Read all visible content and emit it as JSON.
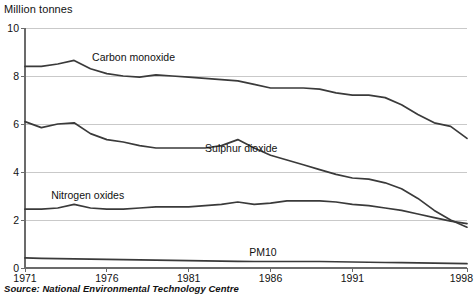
{
  "chart_data": {
    "type": "line",
    "title": "",
    "ylabel": "Million tonnes",
    "xlabel": "",
    "source": "Source: National Environmental Technology Centre",
    "ylim": [
      0,
      10
    ],
    "xlim": [
      1971,
      1998
    ],
    "grid": true,
    "legend_position": "inline-labels",
    "yticks": [
      0,
      2,
      4,
      6,
      8,
      10
    ],
    "ytick_labels": [
      "0",
      "2",
      "4",
      "6",
      "8",
      "10"
    ],
    "xticks": [
      1971,
      1976,
      1981,
      1986,
      1991,
      1998
    ],
    "xtick_labels": [
      "1971",
      "1976",
      "1981",
      "1986",
      "1991",
      "1998"
    ],
    "x": [
      1971,
      1972,
      1973,
      1974,
      1975,
      1976,
      1977,
      1978,
      1979,
      1980,
      1981,
      1982,
      1983,
      1984,
      1985,
      1986,
      1987,
      1988,
      1989,
      1990,
      1991,
      1992,
      1993,
      1994,
      1995,
      1996,
      1997,
      1998
    ],
    "series": [
      {
        "name": "Carbon monoxide",
        "label": "Carbon monoxide",
        "color": "#3a3a3a",
        "label_x": 1975.1,
        "label_y": 8.75,
        "values": [
          8.4,
          8.4,
          8.5,
          8.65,
          8.3,
          8.1,
          8.0,
          7.95,
          8.05,
          8.0,
          7.95,
          7.9,
          7.85,
          7.8,
          7.65,
          7.5,
          7.5,
          7.5,
          7.45,
          7.3,
          7.2,
          7.2,
          7.1,
          6.8,
          6.4,
          6.05,
          5.9,
          5.4
        ]
      },
      {
        "name": "Sulphur dioxide",
        "label": "Sulphur dioxide",
        "color": "#3a3a3a",
        "label_x": 1982.0,
        "label_y": 4.95,
        "values": [
          6.1,
          5.85,
          6.0,
          6.05,
          5.6,
          5.35,
          5.25,
          5.1,
          5.0,
          5.0,
          5.0,
          5.0,
          5.1,
          5.35,
          5.0,
          4.7,
          4.5,
          4.3,
          4.1,
          3.9,
          3.75,
          3.7,
          3.55,
          3.3,
          2.9,
          2.4,
          2.0,
          1.7
        ]
      },
      {
        "name": "Nitrogen oxides",
        "label": "Nitrogen oxides",
        "color": "#3a3a3a",
        "label_x": 1972.6,
        "label_y": 2.98,
        "values": [
          2.45,
          2.45,
          2.5,
          2.65,
          2.5,
          2.45,
          2.45,
          2.5,
          2.55,
          2.55,
          2.55,
          2.6,
          2.65,
          2.75,
          2.65,
          2.7,
          2.8,
          2.8,
          2.8,
          2.75,
          2.65,
          2.6,
          2.5,
          2.4,
          2.25,
          2.1,
          1.95,
          1.85
        ]
      },
      {
        "name": "PM10",
        "label": "PM10",
        "color": "#3a3a3a",
        "label_x": 1984.7,
        "label_y": 0.62,
        "values": [
          0.42,
          0.4,
          0.39,
          0.38,
          0.37,
          0.36,
          0.35,
          0.34,
          0.33,
          0.32,
          0.31,
          0.3,
          0.29,
          0.28,
          0.27,
          0.27,
          0.27,
          0.27,
          0.27,
          0.26,
          0.25,
          0.24,
          0.23,
          0.22,
          0.21,
          0.2,
          0.19,
          0.18
        ]
      }
    ]
  }
}
